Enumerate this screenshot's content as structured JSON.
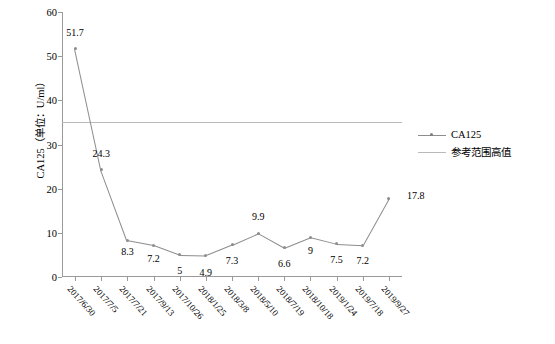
{
  "chart_data": {
    "type": "line",
    "title": "",
    "xlabel": "",
    "ylabel": "CA125（单位：U/ml）",
    "ylim": [
      0,
      60
    ],
    "yticks": [
      0,
      10,
      20,
      30,
      40,
      50,
      60
    ],
    "grid": false,
    "legend_position": "right",
    "categories": [
      "2017/6/30",
      "2017/7/5",
      "2017/7/21",
      "2017/9/13",
      "2017/10/26",
      "2018/1/25",
      "2018/3/8",
      "2018/5/10",
      "2018/7/19",
      "2018/10/18",
      "2019/1/24",
      "2019/7/18",
      "2019/9/27"
    ],
    "series": [
      {
        "name": "CA125",
        "values": [
          51.7,
          24.3,
          8.3,
          7.2,
          5,
          4.9,
          7.3,
          9.9,
          6.6,
          9,
          7.5,
          7.2,
          17.8
        ],
        "point_labels": [
          "51.7",
          "24.3",
          "8.3",
          "7.2",
          "5",
          "4.9",
          "7.3",
          "9.9",
          "6.6",
          "9",
          "7.5",
          "7.2",
          "17.8"
        ],
        "color": "#8d8d8d"
      }
    ],
    "reference_line": {
      "name": "参考范围高值",
      "value": 35,
      "color": "#b9b9b9"
    },
    "legend": [
      {
        "label": "CA125",
        "type": "line-marker",
        "color": "#8d8d8d"
      },
      {
        "label": "参考范围高值",
        "type": "line",
        "color": "#b9b9b9"
      }
    ]
  },
  "caption": ""
}
